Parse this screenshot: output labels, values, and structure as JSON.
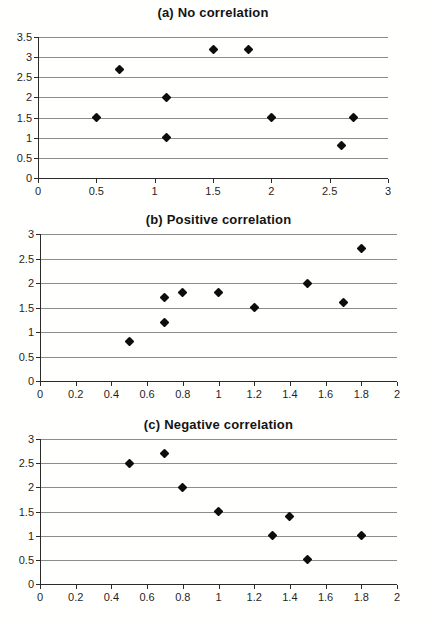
{
  "figure_title": "Scatter plot panels showing types of correlation",
  "chart_data": [
    {
      "type": "scatter",
      "title": "(a) No correlation",
      "points": [
        [
          0.5,
          1.5
        ],
        [
          0.7,
          2.7
        ],
        [
          1.1,
          2.0
        ],
        [
          1.1,
          1.0
        ],
        [
          1.5,
          3.2
        ],
        [
          1.8,
          3.2
        ],
        [
          2.0,
          1.5
        ],
        [
          2.6,
          0.8
        ],
        [
          2.7,
          1.5
        ]
      ],
      "xlabel": "",
      "ylabel": "",
      "xlim": [
        0,
        3
      ],
      "ylim": [
        0,
        3.5
      ],
      "x_ticks": [
        0,
        0.5,
        1,
        1.5,
        2,
        2.5,
        3
      ],
      "y_ticks": [
        0,
        0.5,
        1,
        1.5,
        2,
        2.5,
        3,
        3.5
      ],
      "x_tick_labels": [
        "0",
        "0.5",
        "1",
        "1.5",
        "2",
        "2.5",
        "3"
      ],
      "y_tick_labels": [
        "0",
        "0.5",
        "1",
        "1.5",
        "2",
        "2.5",
        "3",
        "3.5"
      ],
      "grid": "horizontal",
      "legend": "none",
      "marker": "diamond",
      "marker_color": "#0d0d0d",
      "gridline_color": "#8c8c8c",
      "axis_color": "#2b2b2b"
    },
    {
      "type": "scatter",
      "title": "(b) Positive correlation",
      "points": [
        [
          0.5,
          0.8
        ],
        [
          0.7,
          1.2
        ],
        [
          0.7,
          1.7
        ],
        [
          0.8,
          1.8
        ],
        [
          1.0,
          1.8
        ],
        [
          1.2,
          1.5
        ],
        [
          1.5,
          2.0
        ],
        [
          1.7,
          1.6
        ],
        [
          1.8,
          2.7
        ]
      ],
      "xlabel": "",
      "ylabel": "",
      "xlim": [
        0,
        2
      ],
      "ylim": [
        0,
        3
      ],
      "x_ticks": [
        0,
        0.2,
        0.4,
        0.6,
        0.8,
        1,
        1.2,
        1.4,
        1.6,
        1.8,
        2
      ],
      "y_ticks": [
        0,
        0.5,
        1,
        1.5,
        2,
        2.5,
        3
      ],
      "x_tick_labels": [
        "0",
        "0.2",
        "0.4",
        "0.6",
        "0.8",
        "1",
        "1.2",
        "1.4",
        "1.6",
        "1.8",
        "2"
      ],
      "y_tick_labels": [
        "0",
        "0.5",
        "1",
        "1.5",
        "2",
        "2.5",
        "3"
      ],
      "grid": "horizontal",
      "legend": "none",
      "marker": "diamond",
      "marker_color": "#0d0d0d",
      "gridline_color": "#8c8c8c",
      "axis_color": "#2b2b2b"
    },
    {
      "type": "scatter",
      "title": "(c) Negative correlation",
      "points": [
        [
          0.5,
          2.5
        ],
        [
          0.7,
          2.7
        ],
        [
          0.8,
          2.0
        ],
        [
          1.0,
          1.5
        ],
        [
          1.3,
          1.0
        ],
        [
          1.4,
          1.4
        ],
        [
          1.5,
          0.5
        ],
        [
          1.8,
          1.0
        ]
      ],
      "xlabel": "",
      "ylabel": "",
      "xlim": [
        0,
        2
      ],
      "ylim": [
        0,
        3
      ],
      "x_ticks": [
        0,
        0.2,
        0.4,
        0.6,
        0.8,
        1,
        1.2,
        1.4,
        1.6,
        1.8,
        2
      ],
      "y_ticks": [
        0,
        0.5,
        1,
        1.5,
        2,
        2.5,
        3
      ],
      "x_tick_labels": [
        "0",
        "0.2",
        "0.4",
        "0.6",
        "0.8",
        "1",
        "1.2",
        "1.4",
        "1.6",
        "1.8",
        "2"
      ],
      "y_tick_labels": [
        "0",
        "0.5",
        "1",
        "1.5",
        "2",
        "2.5",
        "3"
      ],
      "grid": "horizontal",
      "legend": "none",
      "marker": "diamond",
      "marker_color": "#0d0d0d",
      "gridline_color": "#8c8c8c",
      "axis_color": "#2b2b2b"
    }
  ]
}
